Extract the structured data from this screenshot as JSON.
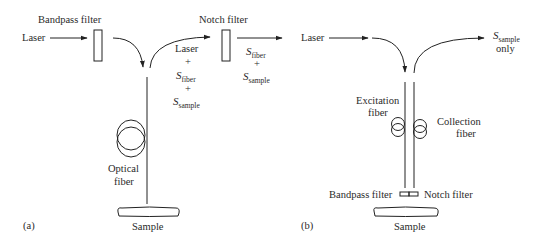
{
  "panel_a": {
    "label": "(a)",
    "input_label": "Laser",
    "bandpass_label": "Bandpass filter",
    "notch_label": "Notch filter",
    "mixed_signal": {
      "line1": "Laser",
      "plus1": "+",
      "s_fiber": "S",
      "s_fiber_sub": "fiber",
      "plus2": "+",
      "s_sample": "S",
      "s_sample_sub": "sample"
    },
    "after_notch": {
      "s_fiber": "S",
      "s_fiber_sub": "fiber",
      "plus": "+",
      "s_sample": "S",
      "s_sample_sub": "sample"
    },
    "fiber_label_1": "Optical",
    "fiber_label_2": "fiber",
    "sample_label": "Sample"
  },
  "panel_b": {
    "label": "(b)",
    "input_label": "Laser",
    "output_s": "S",
    "output_sub": "sample",
    "output_only": "only",
    "excitation_1": "Excitation",
    "excitation_2": "fiber",
    "collection_1": "Collection",
    "collection_2": "fiber",
    "bandpass_label": "Bandpass filter",
    "notch_label": "Notch filter",
    "sample_label": "Sample"
  },
  "colors": {
    "line": "#222222",
    "text": "#2a2a2a",
    "background": "#ffffff"
  }
}
